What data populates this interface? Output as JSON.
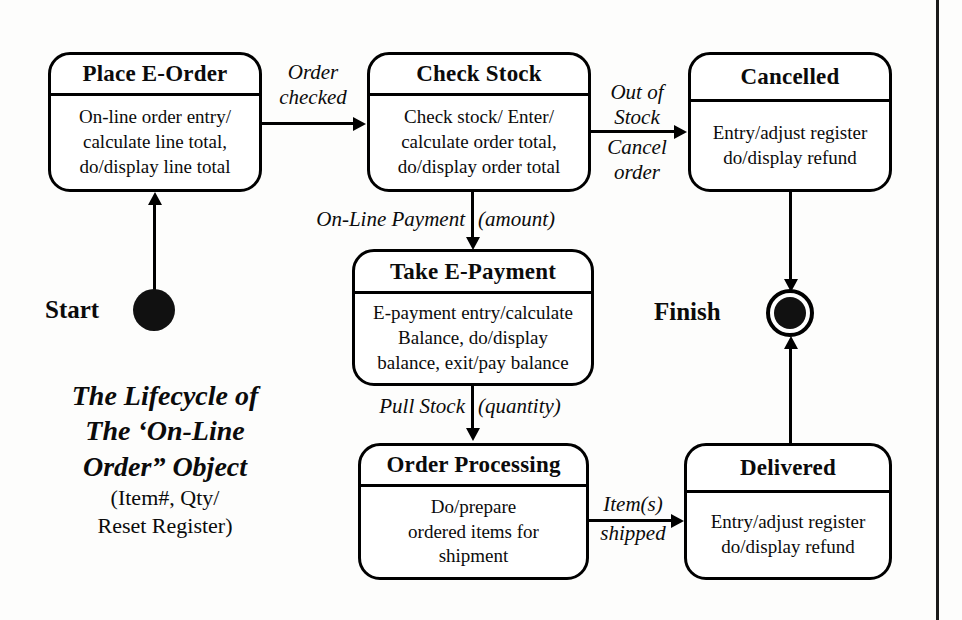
{
  "diagram": {
    "caption": {
      "line1": "The Lifecycle of",
      "line2": "The ‘On-Line",
      "line3": "Order” Object",
      "line4": "(Item#, Qty/",
      "line5": "Reset Register)"
    },
    "markers": {
      "start_label": "Start",
      "finish_label": "Finish"
    },
    "states": [
      {
        "id": "place-e-order",
        "name": "Place E-Order",
        "body": [
          "On-line order entry/",
          "calculate line total,",
          "do/display line total"
        ]
      },
      {
        "id": "check-stock",
        "name": "Check Stock",
        "body": [
          "Check stock/ Enter/",
          "calculate order total,",
          "do/display order total"
        ]
      },
      {
        "id": "cancelled",
        "name": "Cancelled",
        "body": [
          "Entry/adjust register",
          "do/display refund"
        ]
      },
      {
        "id": "take-e-payment",
        "name": "Take E-Payment",
        "body": [
          "E-payment entry/calculate",
          "Balance, do/display",
          "balance, exit/pay balance"
        ]
      },
      {
        "id": "order-processing",
        "name": "Order Processing",
        "body": [
          "Do/prepare",
          "ordered items for",
          "shipment"
        ]
      },
      {
        "id": "delivered",
        "name": "Delivered",
        "body": [
          "Entry/adjust register",
          "do/display refund"
        ]
      }
    ],
    "transitions": [
      {
        "id": "start-to-place",
        "from": "start",
        "to": "place-e-order",
        "label": ""
      },
      {
        "id": "place-to-check",
        "from": "place-e-order",
        "to": "check-stock",
        "label_line1": "Order",
        "label_line2": "checked"
      },
      {
        "id": "check-to-cancelled",
        "from": "check-stock",
        "to": "cancelled",
        "label_above_line1": "Out of",
        "label_above_line2": "Stock",
        "label_below_line1": "Cancel",
        "label_below_line2": "order"
      },
      {
        "id": "check-to-payment",
        "from": "check-stock",
        "to": "take-e-payment",
        "label_left": "On-Line Payment",
        "label_right": "(amount)"
      },
      {
        "id": "payment-to-processing",
        "from": "take-e-payment",
        "to": "order-processing",
        "label_left": "Pull Stock",
        "label_right": "(quantity)"
      },
      {
        "id": "processing-to-delivered",
        "from": "order-processing",
        "to": "delivered",
        "label_above": "Item(s)",
        "label_below": "shipped"
      },
      {
        "id": "cancelled-to-finish",
        "from": "cancelled",
        "to": "finish",
        "label": ""
      },
      {
        "id": "delivered-to-finish",
        "from": "delivered",
        "to": "finish",
        "label": ""
      }
    ],
    "colors": {
      "ink": "#000000",
      "paper": "#fdfdfc",
      "text": "#0b0b0b"
    }
  }
}
